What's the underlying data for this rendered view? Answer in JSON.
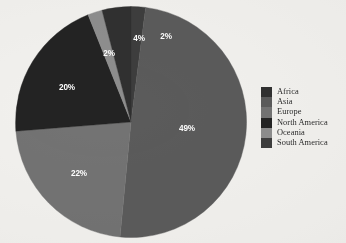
{
  "chart_data": {
    "type": "pie",
    "title": "",
    "subtitle": "",
    "xlabel": "",
    "ylabel": "",
    "legend_position": "right",
    "grid": false,
    "categories": [
      "Africa",
      "Asia",
      "Europe",
      "North America",
      "Oceania",
      "South America"
    ],
    "values": [
      4,
      49,
      22,
      20,
      2,
      2
    ],
    "labels": [
      "4%",
      "49%",
      "22%",
      "20%",
      "2%",
      "2%"
    ],
    "colors": [
      "#303030",
      "#5b5b5b",
      "#737373",
      "#232323",
      "#8e8e8e",
      "#3d3d3d"
    ],
    "slices": [
      {
        "name": "Africa",
        "value": 4,
        "label": "4%",
        "color": "#303030",
        "start_deg": 337.0,
        "end_deg": 351.4
      },
      {
        "name": "Asia",
        "value": 49,
        "label": "49%",
        "color": "#5b5b5b",
        "start_deg": 7.2,
        "end_deg": 183.6
      },
      {
        "name": "Europe",
        "value": 22,
        "label": "22%",
        "color": "#737373",
        "start_deg": 183.6,
        "end_deg": 262.8
      },
      {
        "name": "North America",
        "value": 20,
        "label": "20%",
        "color": "#232323",
        "start_deg": 262.8,
        "end_deg": 334.8
      },
      {
        "name": "Oceania",
        "value": 2,
        "label": "2%",
        "color": "#8e8e8e",
        "start_deg": 334.8,
        "end_deg": 342.0
      },
      {
        "name": "South America",
        "value": 2,
        "label": "2%",
        "color": "#3d3d3d",
        "start_deg": 0.0,
        "end_deg": 7.2
      }
    ]
  },
  "chart": {
    "slice_labels": {
      "asia": "49%",
      "europe": "22%",
      "north_america": "20%",
      "oceania": "2%",
      "africa": "4%",
      "south_america": "2%"
    }
  },
  "legend": {
    "items": [
      {
        "label": "Africa",
        "color": "#303030"
      },
      {
        "label": "Asia",
        "color": "#5b5b5b"
      },
      {
        "label": "Europe",
        "color": "#737373"
      },
      {
        "label": "North America",
        "color": "#232323"
      },
      {
        "label": "Oceania",
        "color": "#8e8e8e"
      },
      {
        "label": "South America",
        "color": "#3d3d3d"
      }
    ]
  },
  "theme": {
    "background": "#f2f1ee",
    "label_text_color": "#ffffff",
    "legend_text_color": "#2b2b2b"
  }
}
